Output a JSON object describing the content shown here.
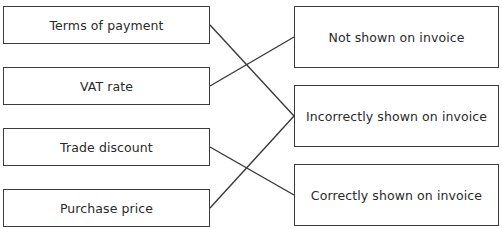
{
  "left_items": [
    {
      "label": "Terms of payment"
    },
    {
      "label": "VAT rate"
    },
    {
      "label": "Trade discount"
    },
    {
      "label": "Purchase price"
    }
  ],
  "right_items": [
    {
      "label": "Not shown on invoice"
    },
    {
      "label": "Incorrectly shown on invoice"
    },
    {
      "label": "Correctly shown on invoice"
    }
  ],
  "connections": [
    {
      "from": 0,
      "to": 1
    },
    {
      "from": 1,
      "to": 0
    },
    {
      "from": 2,
      "to": 2
    },
    {
      "from": 3,
      "to": 1
    }
  ]
}
